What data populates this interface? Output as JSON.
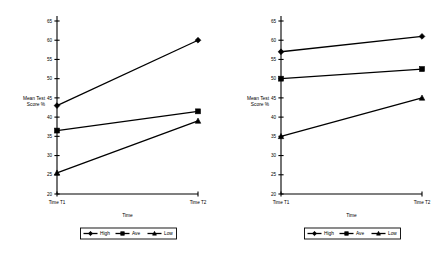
{
  "chart_data": [
    {
      "type": "line",
      "panel": "left",
      "title": "",
      "xlabel": "Time",
      "ylabel": "Mean Test Score %",
      "ylabel_line1": "Mean Test",
      "ylabel_line2": "Score %",
      "categories": [
        "Time T1",
        "Time T2"
      ],
      "x": [
        "Time T1",
        "Time T2"
      ],
      "ylim": [
        20,
        65
      ],
      "yticks": [
        20,
        25,
        30,
        35,
        40,
        45,
        50,
        55,
        60,
        65
      ],
      "ytick_labels": [
        "20",
        "25",
        "30",
        "35",
        "40",
        "45",
        "50",
        "55",
        "60",
        "65"
      ],
      "grid": false,
      "legend_position": "bottom",
      "series": [
        {
          "name": "High",
          "marker": "diamond",
          "values": [
            43,
            60
          ]
        },
        {
          "name": "Ave",
          "marker": "square",
          "values": [
            36.5,
            41.5
          ]
        },
        {
          "name": "Low",
          "marker": "triangle",
          "values": [
            25.5,
            39
          ]
        }
      ]
    },
    {
      "type": "line",
      "panel": "right",
      "title": "",
      "xlabel": "Time",
      "ylabel": "Mean Test Score %",
      "ylabel_line1": "Mean Test",
      "ylabel_line2": "Score %",
      "categories": [
        "Time T1",
        "Time T2"
      ],
      "x": [
        "Time T1",
        "Time T2"
      ],
      "ylim": [
        20,
        65
      ],
      "yticks": [
        20,
        25,
        30,
        35,
        40,
        45,
        50,
        55,
        60,
        65
      ],
      "ytick_labels": [
        "20",
        "25",
        "30",
        "35",
        "40",
        "45",
        "50",
        "55",
        "60",
        "65"
      ],
      "grid": false,
      "legend_position": "bottom",
      "series": [
        {
          "name": "High",
          "marker": "diamond",
          "values": [
            57,
            61
          ]
        },
        {
          "name": "Ave",
          "marker": "square",
          "values": [
            50,
            52.5
          ]
        },
        {
          "name": "Low",
          "marker": "triangle",
          "values": [
            35,
            45
          ]
        }
      ]
    }
  ]
}
